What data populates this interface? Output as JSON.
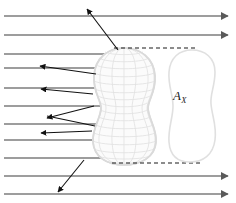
{
  "figure": {
    "background_color": "#ffffff",
    "width": 236,
    "height": 203
  },
  "labels": {
    "cross_section_area": "A",
    "cross_section_subscript": "X",
    "cross_section_full": "A_X",
    "cross_section_color": "#1a1a1a",
    "cross_section_x": 173,
    "cross_section_y": 96
  },
  "colors": {
    "incident_ray": "#7c7c7c",
    "scattered_ray": "#111111",
    "mesh_line": "#e3e3e3",
    "mesh_outline": "#dcdcdc",
    "projection_dash": "#1a1a1a",
    "cross_section_outline": "#e0e0e0",
    "cross_section_fill": "#ffffff"
  },
  "incident_beam": {
    "name": "incident-parallel-rays",
    "ray_count": 11,
    "x_start": 4,
    "stroke_width": 1.3,
    "rays": [
      {
        "y": 16,
        "x_end": 228,
        "arrow_right": true,
        "passes_body": false
      },
      {
        "y": 35,
        "x_end": 228,
        "arrow_right": true,
        "passes_body": false
      },
      {
        "y": 54,
        "x_end": 113,
        "arrow_right": false,
        "passes_body": true
      },
      {
        "y": 68,
        "x_end": 104,
        "arrow_right": false,
        "passes_body": true
      },
      {
        "y": 88,
        "x_end": 101,
        "arrow_right": false,
        "passes_body": true
      },
      {
        "y": 106,
        "x_end": 100,
        "arrow_right": false,
        "passes_body": true
      },
      {
        "y": 124,
        "x_end": 103,
        "arrow_right": false,
        "passes_body": true
      },
      {
        "y": 140,
        "x_end": 106,
        "arrow_right": false,
        "passes_body": true
      },
      {
        "y": 158,
        "x_end": 112,
        "arrow_right": false,
        "passes_body": true
      },
      {
        "y": 176,
        "x_end": 228,
        "arrow_right": true,
        "passes_body": false
      },
      {
        "y": 194,
        "x_end": 228,
        "arrow_right": true,
        "passes_body": false
      }
    ]
  },
  "scattered_rays": {
    "name": "scattered-rays",
    "stroke_width": 1.1,
    "count": 7,
    "rays": [
      {
        "id": "scatter-up",
        "x1": 118,
        "y1": 50,
        "x2": 87,
        "y2": 9
      },
      {
        "id": "scatter-left-1",
        "x1": 96,
        "y1": 74,
        "x2": 40,
        "y2": 66
      },
      {
        "id": "scatter-left-2",
        "x1": 93,
        "y1": 94,
        "x2": 41,
        "y2": 89
      },
      {
        "id": "scatter-left-3",
        "x1": 94,
        "y1": 106,
        "x2": 47,
        "y2": 118
      },
      {
        "id": "scatter-left-4",
        "x1": 95,
        "y1": 126,
        "x2": 47,
        "y2": 116
      },
      {
        "id": "scatter-left-5",
        "x1": 92,
        "y1": 131,
        "x2": 41,
        "y2": 133
      },
      {
        "id": "scatter-down",
        "x1": 84,
        "y1": 160,
        "x2": 58,
        "y2": 192
      }
    ]
  },
  "projection_lines": {
    "name": "projection-dashed-lines",
    "dash_pattern": "4 3",
    "stroke_width": 1.2,
    "lines": [
      {
        "id": "projection-top",
        "x1": 114,
        "y1": 48,
        "x2": 198,
        "y2": 48
      },
      {
        "id": "projection-bottom",
        "x1": 112,
        "y1": 163,
        "x2": 200,
        "y2": 163
      }
    ]
  },
  "body": {
    "name": "wireframe-body",
    "shape": "peanut",
    "center_x": 124,
    "top_y": 48,
    "bottom_y": 164,
    "left_x": 94,
    "right_x": 156,
    "meridian_count": 9,
    "parallel_count": 17
  },
  "cross_section": {
    "name": "projected-cross-section",
    "left_x": 168,
    "right_x": 216,
    "top_y": 50,
    "bottom_y": 162
  }
}
